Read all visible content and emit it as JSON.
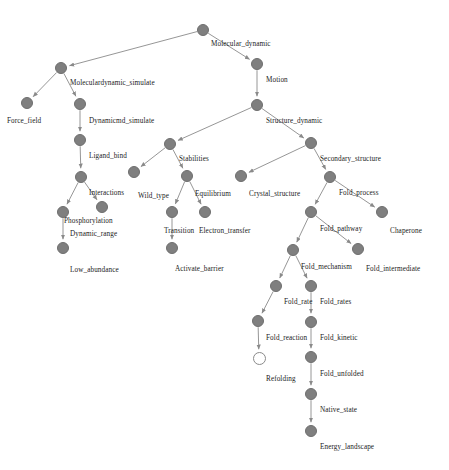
{
  "diagram": {
    "type": "directed-tree",
    "node_color": "#7f7f7f",
    "edge_color": "#8a8a8a",
    "background": "#ffffff",
    "nodes": [
      {
        "id": "molecular_dynamic",
        "label": "Molecular_dynamic",
        "x": 203,
        "y": 30,
        "lx": 211,
        "ly": 40,
        "filled": true
      },
      {
        "id": "moleculardynamic_simulate",
        "label": "Moleculardynamic_simulate",
        "x": 61,
        "y": 68,
        "lx": 70,
        "ly": 79,
        "filled": true
      },
      {
        "id": "motion",
        "label": "Motion",
        "x": 257,
        "y": 64,
        "lx": 266,
        "ly": 76,
        "filled": true
      },
      {
        "id": "force_field",
        "label": "Force_field",
        "x": 27,
        "y": 103,
        "lx": 7,
        "ly": 117,
        "filled": true
      },
      {
        "id": "dynamicmd_simulate",
        "label": "Dynamicmd_simulate",
        "x": 80,
        "y": 104,
        "lx": 89,
        "ly": 117,
        "filled": true
      },
      {
        "id": "structure_dynamic",
        "label": "Structure_dynamic",
        "x": 257,
        "y": 105,
        "lx": 266,
        "ly": 117,
        "filled": true
      },
      {
        "id": "ligand_bind",
        "label": "Ligand_bind",
        "x": 80,
        "y": 140,
        "lx": 89,
        "ly": 152,
        "filled": true
      },
      {
        "id": "stabilities",
        "label": "Stabilities",
        "x": 170,
        "y": 144,
        "lx": 179,
        "ly": 155,
        "filled": true
      },
      {
        "id": "secondary_structure",
        "label": "Secondary_structure",
        "x": 311,
        "y": 143,
        "lx": 320,
        "ly": 155,
        "filled": true
      },
      {
        "id": "interactions",
        "label": "Interactions",
        "x": 81,
        "y": 177,
        "lx": 89,
        "ly": 189,
        "filled": true
      },
      {
        "id": "wild_type",
        "label": "Wild_type",
        "x": 134,
        "y": 172,
        "lx": 138,
        "ly": 192,
        "filled": true
      },
      {
        "id": "equilibrium",
        "label": "Equilibrium",
        "x": 187,
        "y": 176,
        "lx": 195,
        "ly": 190,
        "filled": true
      },
      {
        "id": "crystal_structure",
        "label": "Crystal_structure",
        "x": 241,
        "y": 176,
        "lx": 249,
        "ly": 190,
        "filled": true
      },
      {
        "id": "fold_process",
        "label": "Fold_process",
        "x": 330,
        "y": 177,
        "lx": 339,
        "ly": 189,
        "filled": true
      },
      {
        "id": "phosphorylation",
        "label": "Phosphorylation",
        "x": 102,
        "y": 207,
        "lx": 64,
        "ly": 217,
        "filled": true
      },
      {
        "id": "transition",
        "label": "Transition",
        "x": 172,
        "y": 212,
        "lx": 164,
        "ly": 227,
        "filled": true
      },
      {
        "id": "electron_transfer",
        "label": "Electron_transfer",
        "x": 205,
        "y": 212,
        "lx": 199,
        "ly": 227,
        "filled": true
      },
      {
        "id": "dynamic_range",
        "label": "Dynamic_range",
        "x": 63,
        "y": 212,
        "lx": 70,
        "ly": 230,
        "filled": true
      },
      {
        "id": "fold_pathway",
        "label": "Fold_pathway",
        "x": 311,
        "y": 212,
        "lx": 320,
        "ly": 225,
        "filled": true
      },
      {
        "id": "chaperone",
        "label": "Chaperone",
        "x": 382,
        "y": 212,
        "lx": 390,
        "ly": 227,
        "filled": true
      },
      {
        "id": "low_abundance",
        "label": "Low_abundance",
        "x": 63,
        "y": 248,
        "lx": 70,
        "ly": 266,
        "filled": true
      },
      {
        "id": "activate_barrier",
        "label": "Activate_barrier",
        "x": 172,
        "y": 248,
        "lx": 175,
        "ly": 265,
        "filled": true
      },
      {
        "id": "fold_mechanism",
        "label": "Fold_mechanism",
        "x": 293,
        "y": 250,
        "lx": 301,
        "ly": 263,
        "filled": true
      },
      {
        "id": "fold_intermediate",
        "label": "Fold_intermediate",
        "x": 358,
        "y": 249,
        "lx": 366,
        "ly": 265,
        "filled": true
      },
      {
        "id": "fold_rate",
        "label": "Fold_rate",
        "x": 276,
        "y": 286,
        "lx": 284,
        "ly": 298,
        "filled": true
      },
      {
        "id": "fold_rates",
        "label": "Fold_rates",
        "x": 311,
        "y": 286,
        "lx": 320,
        "ly": 298,
        "filled": true
      },
      {
        "id": "fold_reaction",
        "label": "Fold_reaction",
        "x": 258,
        "y": 321,
        "lx": 266,
        "ly": 334,
        "filled": true
      },
      {
        "id": "fold_kinetic",
        "label": "Fold_kinetic",
        "x": 311,
        "y": 322,
        "lx": 320,
        "ly": 334,
        "filled": true
      },
      {
        "id": "refolding",
        "label": "Refolding",
        "x": 259,
        "y": 358,
        "lx": 266,
        "ly": 375,
        "filled": false
      },
      {
        "id": "fold_unfolded",
        "label": "Fold_unfolded",
        "x": 311,
        "y": 357,
        "lx": 320,
        "ly": 370,
        "filled": true
      },
      {
        "id": "native_state",
        "label": "Native_state",
        "x": 311,
        "y": 394,
        "lx": 320,
        "ly": 406,
        "filled": true
      },
      {
        "id": "energy_landscape",
        "label": "Energy_landscape",
        "x": 311,
        "y": 431,
        "lx": 320,
        "ly": 443,
        "filled": true
      }
    ],
    "edges": [
      {
        "from": "molecular_dynamic",
        "to": "moleculardynamic_simulate"
      },
      {
        "from": "molecular_dynamic",
        "to": "motion"
      },
      {
        "from": "moleculardynamic_simulate",
        "to": "force_field"
      },
      {
        "from": "moleculardynamic_simulate",
        "to": "dynamicmd_simulate"
      },
      {
        "from": "motion",
        "to": "structure_dynamic"
      },
      {
        "from": "dynamicmd_simulate",
        "to": "ligand_bind"
      },
      {
        "from": "structure_dynamic",
        "to": "stabilities"
      },
      {
        "from": "structure_dynamic",
        "to": "secondary_structure"
      },
      {
        "from": "ligand_bind",
        "to": "interactions"
      },
      {
        "from": "stabilities",
        "to": "wild_type"
      },
      {
        "from": "stabilities",
        "to": "equilibrium"
      },
      {
        "from": "secondary_structure",
        "to": "crystal_structure"
      },
      {
        "from": "secondary_structure",
        "to": "fold_process"
      },
      {
        "from": "interactions",
        "to": "phosphorylation"
      },
      {
        "from": "interactions",
        "to": "dynamic_range"
      },
      {
        "from": "equilibrium",
        "to": "transition"
      },
      {
        "from": "equilibrium",
        "to": "electron_transfer"
      },
      {
        "from": "fold_process",
        "to": "fold_pathway"
      },
      {
        "from": "fold_process",
        "to": "chaperone"
      },
      {
        "from": "dynamic_range",
        "to": "low_abundance"
      },
      {
        "from": "transition",
        "to": "activate_barrier"
      },
      {
        "from": "fold_pathway",
        "to": "fold_mechanism"
      },
      {
        "from": "fold_pathway",
        "to": "fold_intermediate"
      },
      {
        "from": "fold_mechanism",
        "to": "fold_rate"
      },
      {
        "from": "fold_mechanism",
        "to": "fold_rates"
      },
      {
        "from": "fold_rate",
        "to": "fold_reaction"
      },
      {
        "from": "fold_rates",
        "to": "fold_kinetic"
      },
      {
        "from": "fold_reaction",
        "to": "refolding"
      },
      {
        "from": "fold_kinetic",
        "to": "fold_unfolded"
      },
      {
        "from": "fold_unfolded",
        "to": "native_state"
      },
      {
        "from": "native_state",
        "to": "energy_landscape"
      }
    ]
  }
}
